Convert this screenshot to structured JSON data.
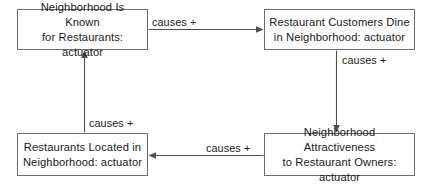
{
  "diagram": {
    "type": "causal-loop-diagram",
    "background_color": "#ffffff",
    "box_border_color": "#6e6e6e",
    "edge_color": "#4d4d4d",
    "text_color": "#1a1a1a",
    "nodes": [
      {
        "id": "known-for-restaurants",
        "label": "Neighborhood Is Known\nfor Restaurants: actuator",
        "position": "top-left"
      },
      {
        "id": "customers-dine",
        "label": "Restaurant Customers Dine\nin Neighborhood: actuator",
        "position": "top-right"
      },
      {
        "id": "restaurants-located",
        "label": "Restaurants Located in\nNeighborhood: actuator",
        "position": "bottom-left"
      },
      {
        "id": "attractiveness",
        "label": "Neighborhood Attractiveness\nto Restaurant Owners: actuator",
        "position": "bottom-right"
      }
    ],
    "edges": [
      {
        "id": "top",
        "label": "causes +",
        "from": "known-for-restaurants",
        "to": "customers-dine"
      },
      {
        "id": "right",
        "label": "causes +",
        "from": "customers-dine",
        "to": "attractiveness"
      },
      {
        "id": "bottom",
        "label": "causes +",
        "from": "attractiveness",
        "to": "restaurants-located"
      },
      {
        "id": "left",
        "label": "causes +",
        "from": "restaurants-located",
        "to": "known-for-restaurants"
      }
    ]
  }
}
